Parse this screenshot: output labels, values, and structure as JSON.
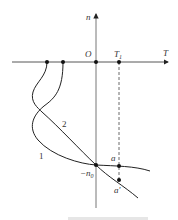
{
  "diagram": {
    "axes": {
      "vertical_label": "n",
      "horizontal_label": "T",
      "origin_label": "O",
      "tick_label": "T",
      "tick_subscript": "1"
    },
    "points": {
      "neg_n0_label": "−n",
      "neg_n0_subscript": "0",
      "a_label": "a",
      "a_prime_label": "a′"
    },
    "curves": [
      {
        "label": "1"
      },
      {
        "label": "2"
      }
    ],
    "colors": {
      "stroke": "#222222",
      "axis": "#555555"
    }
  }
}
